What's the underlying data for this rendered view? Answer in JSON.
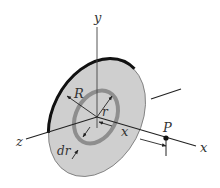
{
  "diagram": {
    "colors": {
      "disk_fill": "#cfcfcf",
      "ring": "#8e8e8e",
      "rim": "#111111",
      "axis": "#333333",
      "background": "#ffffff"
    },
    "labels": {
      "y_axis": "y",
      "z_axis": "z",
      "x_axis": "x",
      "disk_radius": "R",
      "ring_radius": "r",
      "ring_width": "dr",
      "distance": "x",
      "point": "P"
    }
  }
}
